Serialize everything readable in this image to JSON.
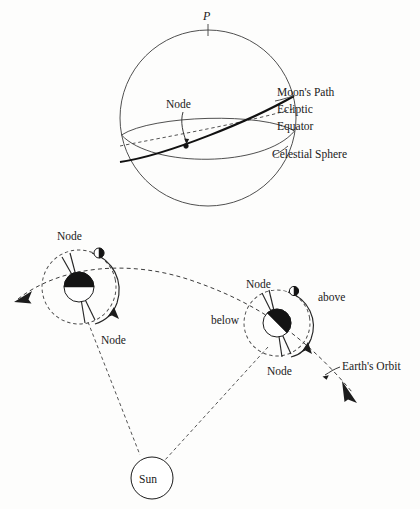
{
  "figure": {
    "background_color": "#fdfdfc",
    "ink_color": "#1a1a1a"
  },
  "top_diagram": {
    "name": "celestial-sphere-diagram",
    "pole_label": "P",
    "node_label": "Node",
    "labels": {
      "moons_path": "Moon's Path",
      "ecliptic": "Ecliptic",
      "equator": "Equator",
      "celestial_sphere": "Celestial Sphere"
    }
  },
  "bottom_diagram": {
    "name": "earth-moon-orbit-diagram",
    "sun_label": "Sun",
    "left_system": {
      "node_upper_label": "Node",
      "node_lower_label": "Node"
    },
    "right_system": {
      "node_upper_label": "Node",
      "node_lower_label": "Node",
      "above_label": "above",
      "below_label": "below"
    },
    "earths_orbit_label": "Earth's Orbit"
  }
}
